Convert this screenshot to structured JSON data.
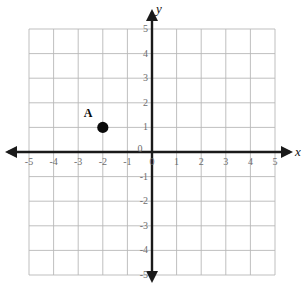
{
  "chart_data": {
    "type": "scatter",
    "title": "",
    "xlabel": "x",
    "ylabel": "y",
    "xlim": [
      -5,
      5
    ],
    "ylim": [
      -5,
      5
    ],
    "grid": true,
    "grid_step": 1,
    "legend": "none",
    "x_tick_labels": [
      "-5",
      "-4",
      "-3",
      "-2",
      "-1",
      "0",
      "1",
      "2",
      "3",
      "4",
      "5"
    ],
    "y_tick_labels": [
      "-5",
      "-4",
      "-3",
      "-2",
      "-1",
      "0",
      "1",
      "2",
      "3",
      "4",
      "5"
    ],
    "points": [
      {
        "label": "A",
        "x": -2,
        "y": 1
      }
    ],
    "origin_label": "0"
  },
  "axes": {
    "x_name": "x",
    "y_name": "y",
    "x_origin_zero": "0",
    "y_origin_zero": "0"
  },
  "ticks": {
    "x": [
      {
        "value": -5,
        "label": "-5"
      },
      {
        "value": -4,
        "label": "-4"
      },
      {
        "value": -3,
        "label": "-3"
      },
      {
        "value": -2,
        "label": "-2"
      },
      {
        "value": -1,
        "label": "-1"
      },
      {
        "value": 1,
        "label": "1"
      },
      {
        "value": 2,
        "label": "2"
      },
      {
        "value": 3,
        "label": "3"
      },
      {
        "value": 4,
        "label": "4"
      },
      {
        "value": 5,
        "label": "5"
      }
    ],
    "y": [
      {
        "value": 5,
        "label": "5"
      },
      {
        "value": 4,
        "label": "4"
      },
      {
        "value": 3,
        "label": "3"
      },
      {
        "value": 2,
        "label": "2"
      },
      {
        "value": 1,
        "label": "1"
      },
      {
        "value": -1,
        "label": "-1"
      },
      {
        "value": -2,
        "label": "-2"
      },
      {
        "value": -3,
        "label": "-3"
      },
      {
        "value": -4,
        "label": "-4"
      },
      {
        "value": -5,
        "label": "-5"
      }
    ]
  },
  "points": [
    {
      "name": "A",
      "label": "A",
      "x": -2,
      "y": 1
    }
  ],
  "colors": {
    "grid": "#b8b8b8",
    "axis": "#1a1a1a",
    "tick_text": "#6d6d6d",
    "point": "#0a0a0a",
    "background": "#ffffff"
  }
}
